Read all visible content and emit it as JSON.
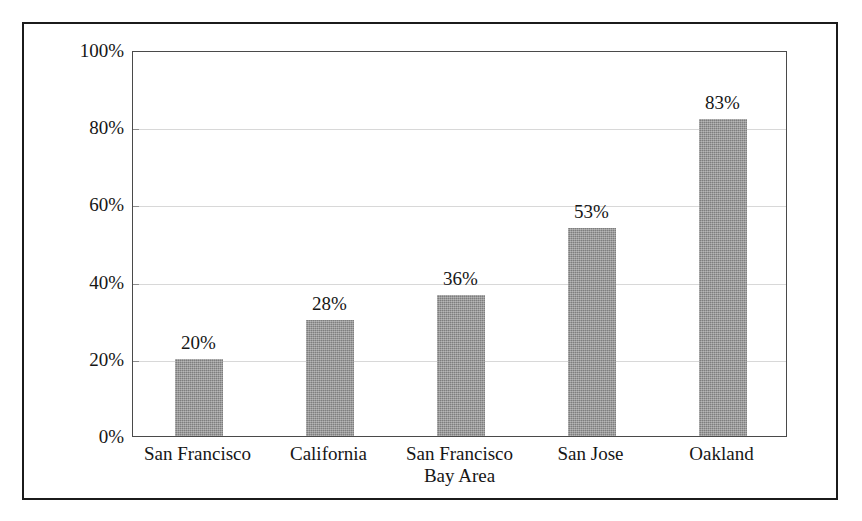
{
  "chart_data": {
    "type": "bar",
    "title": "",
    "subtitle": "",
    "xlabel": "",
    "ylabel": "",
    "categories": [
      "San Francisco",
      "California",
      "San Francisco Bay Area",
      "San Jose",
      "Oakland"
    ],
    "category_lines": [
      [
        "San Francisco"
      ],
      [
        "California"
      ],
      [
        "San Francisco",
        "Bay Area"
      ],
      [
        "San Jose"
      ],
      [
        "Oakland"
      ]
    ],
    "values": [
      20,
      28,
      36,
      53,
      83
    ],
    "plotted_values": [
      20,
      30,
      36.5,
      54,
      82
    ],
    "data_labels": [
      "20%",
      "28%",
      "36%",
      "53%",
      "83%"
    ],
    "ylim": [
      0,
      100
    ],
    "ytick_values": [
      0,
      20,
      40,
      60,
      80,
      100
    ],
    "ytick_labels": [
      "0%",
      "20%",
      "40%",
      "60%",
      "80%",
      "100%"
    ],
    "grid": true,
    "grid_axis": "y",
    "legend": false,
    "legend_position": "none",
    "bar_color": "#8d8d8d",
    "grid_color": "#d8d8d8",
    "axis_color": "#4a4a4a",
    "text_color": "#161616",
    "background_color": "#ffffff",
    "frame_color": "#1b1b1b"
  }
}
